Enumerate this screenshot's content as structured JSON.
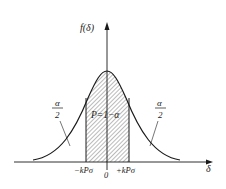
{
  "diagram": {
    "y_axis_label": "f(δ)",
    "x_axis_label": "δ",
    "center_area_label": "P=1−α",
    "left_tail_label": {
      "numerator": "α",
      "denominator": "2"
    },
    "right_tail_label": {
      "numerator": "α",
      "denominator": "2"
    },
    "tick_left": "−kPσ",
    "tick_origin": "0",
    "tick_right": "+kPσ"
  },
  "colors": {
    "line": "#1a1a1a",
    "hatch": "#555555",
    "background": "#ffffff"
  }
}
